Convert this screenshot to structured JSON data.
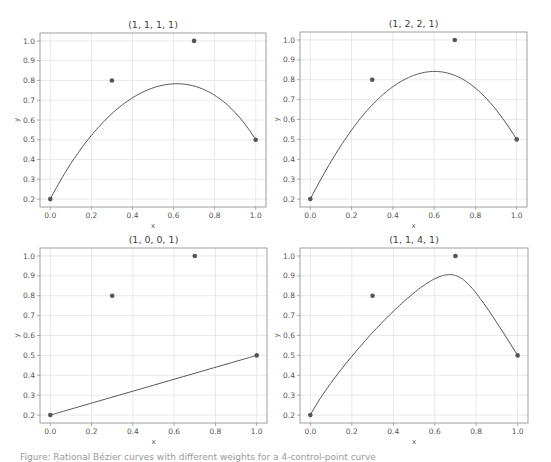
{
  "chart_data": [
    {
      "type": "line",
      "title": "(1, 1, 1, 1)",
      "weights": [
        1,
        1,
        1,
        1
      ],
      "xlabel": "x",
      "ylabel": "y",
      "xlim": [
        -0.05,
        1.05
      ],
      "ylim": [
        0.16,
        1.04
      ],
      "xticks": [
        "0.0",
        "0.2",
        "0.4",
        "0.6",
        "0.8",
        "1.0"
      ],
      "yticks": [
        "0.2",
        "0.3",
        "0.4",
        "0.5",
        "0.6",
        "0.7",
        "0.8",
        "0.9",
        "1.0"
      ],
      "grid": true,
      "control_points": {
        "x": [
          0.0,
          0.3,
          0.7,
          1.0
        ],
        "y": [
          0.2,
          0.8,
          1.0,
          0.5
        ]
      },
      "curve_peak": {
        "x": 0.62,
        "y": 0.785
      },
      "series": [
        {
          "name": "rational Bezier curve",
          "kind": "line"
        },
        {
          "name": "control points",
          "kind": "scatter"
        }
      ]
    },
    {
      "type": "line",
      "title": "(1, 2, 2, 1)",
      "weights": [
        1,
        2,
        2,
        1
      ],
      "xlabel": "x",
      "ylabel": "y",
      "xlim": [
        -0.05,
        1.05
      ],
      "ylim": [
        0.16,
        1.04
      ],
      "xticks": [
        "0.0",
        "0.2",
        "0.4",
        "0.6",
        "0.8",
        "1.0"
      ],
      "yticks": [
        "0.2",
        "0.3",
        "0.4",
        "0.5",
        "0.6",
        "0.7",
        "0.8",
        "0.9",
        "1.0"
      ],
      "grid": true,
      "control_points": {
        "x": [
          0.0,
          0.3,
          0.7,
          1.0
        ],
        "y": [
          0.2,
          0.8,
          1.0,
          0.5
        ]
      },
      "curve_peak": {
        "x": 0.6,
        "y": 0.845
      },
      "series": [
        {
          "name": "rational Bezier curve",
          "kind": "line"
        },
        {
          "name": "control points",
          "kind": "scatter"
        }
      ]
    },
    {
      "type": "line",
      "title": "(1, 0, 0, 1)",
      "weights": [
        1,
        0,
        0,
        1
      ],
      "xlabel": "x",
      "ylabel": "y",
      "xlim": [
        -0.05,
        1.05
      ],
      "ylim": [
        0.16,
        1.04
      ],
      "xticks": [
        "0.0",
        "0.2",
        "0.4",
        "0.6",
        "0.8",
        "1.0"
      ],
      "yticks": [
        "0.2",
        "0.3",
        "0.4",
        "0.5",
        "0.6",
        "0.7",
        "0.8",
        "0.9",
        "1.0"
      ],
      "grid": true,
      "control_points": {
        "x": [
          0.0,
          0.3,
          0.7,
          1.0
        ],
        "y": [
          0.2,
          0.8,
          1.0,
          0.5
        ]
      },
      "curve_peak": {
        "x": 1.0,
        "y": 0.5
      },
      "series": [
        {
          "name": "rational Bezier curve",
          "kind": "line"
        },
        {
          "name": "control points",
          "kind": "scatter"
        }
      ]
    },
    {
      "type": "line",
      "title": "(1, 1, 4, 1)",
      "weights": [
        1,
        1,
        4,
        1
      ],
      "xlabel": "x",
      "ylabel": "y",
      "xlim": [
        -0.05,
        1.05
      ],
      "ylim": [
        0.16,
        1.04
      ],
      "xticks": [
        "0.0",
        "0.2",
        "0.4",
        "0.6",
        "0.8",
        "1.0"
      ],
      "yticks": [
        "0.2",
        "0.3",
        "0.4",
        "0.5",
        "0.6",
        "0.7",
        "0.8",
        "0.9",
        "1.0"
      ],
      "grid": true,
      "control_points": {
        "x": [
          0.0,
          0.3,
          0.7,
          1.0
        ],
        "y": [
          0.2,
          0.8,
          1.0,
          0.5
        ]
      },
      "curve_peak": {
        "x": 0.67,
        "y": 0.91
      },
      "series": [
        {
          "name": "rational Bezier curve",
          "kind": "line"
        },
        {
          "name": "control points",
          "kind": "scatter"
        }
      ]
    }
  ],
  "colors": {
    "curve": "#555555",
    "points": "#555555",
    "grid": "#e3e3e3",
    "spine": "#888888",
    "text": "#555555"
  },
  "caption": "Figure: Rational Bézier curves with different weights for a 4-control-point curve"
}
